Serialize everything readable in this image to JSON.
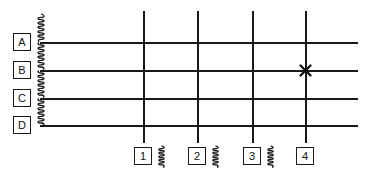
{
  "diagram": {
    "canvas": {
      "width": 371,
      "height": 175
    },
    "stroke_color": "#1a1a1a",
    "background_color": "#ffffff",
    "horizontal_gridlines": [
      {
        "label": "A",
        "y": 42,
        "x_start": 42,
        "x_end": 358
      },
      {
        "label": "B",
        "y": 70,
        "x_start": 42,
        "x_end": 358
      },
      {
        "label": "C",
        "y": 98,
        "x_start": 42,
        "x_end": 358
      },
      {
        "label": "D",
        "y": 125,
        "x_start": 42,
        "x_end": 358
      }
    ],
    "vertical_gridlines": [
      {
        "label": "1",
        "x": 143,
        "y_start": 11,
        "y_end": 143
      },
      {
        "label": "2",
        "x": 197,
        "y_start": 11,
        "y_end": 143
      },
      {
        "label": "3",
        "x": 252,
        "y_start": 11,
        "y_end": 143
      },
      {
        "label": "4",
        "x": 305,
        "y_start": 11,
        "y_end": 143
      }
    ],
    "row_bubbles": [
      {
        "label": "A",
        "x": 13,
        "y": 33
      },
      {
        "label": "B",
        "x": 13,
        "y": 61
      },
      {
        "label": "C",
        "x": 13,
        "y": 89
      },
      {
        "label": "D",
        "x": 13,
        "y": 116
      }
    ],
    "column_bubbles": [
      {
        "label": "1",
        "x": 134,
        "y": 147
      },
      {
        "label": "2",
        "x": 188,
        "y": 147
      },
      {
        "label": "3",
        "x": 243,
        "y": 147
      },
      {
        "label": "4",
        "x": 296,
        "y": 147
      }
    ],
    "break_symbols_vertical": [
      {
        "name": "coil-break-above-A",
        "x": 38,
        "y": 14,
        "height": 28
      },
      {
        "name": "coil-break-A-to-B",
        "x": 38,
        "y": 43,
        "height": 27
      },
      {
        "name": "coil-break-B-to-C",
        "x": 38,
        "y": 71,
        "height": 27
      },
      {
        "name": "coil-break-C-to-D",
        "x": 38,
        "y": 99,
        "height": 26
      }
    ],
    "break_symbols_horizontal": [
      {
        "name": "coil-break-1-to-2",
        "x": 158,
        "y": 145,
        "height": 24
      },
      {
        "name": "coil-break-2-to-3",
        "x": 212,
        "y": 145,
        "height": 24
      },
      {
        "name": "coil-break-3-to-4",
        "x": 267,
        "y": 145,
        "height": 24
      }
    ],
    "markers": [
      {
        "name": "location-x-marker",
        "symbol": "x",
        "grid_reference": "B-4",
        "x": 305,
        "y": 70
      }
    ]
  }
}
